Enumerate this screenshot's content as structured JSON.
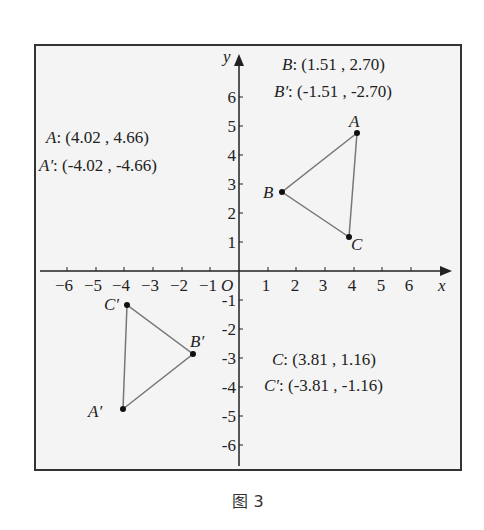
{
  "figure": {
    "caption": "图 3",
    "axes": {
      "x_label": "x",
      "y_label": "y",
      "origin_label": "O",
      "x_ticks": [
        "−6",
        "−5",
        "−4",
        "−3",
        "−2",
        "−1",
        "1",
        "2",
        "3",
        "4",
        "5",
        "6"
      ],
      "y_ticks_pos": [
        "1",
        "2",
        "3",
        "4",
        "5",
        "6"
      ],
      "y_ticks_neg": [
        "-1",
        "-2",
        "-3",
        "-4",
        "-5",
        "-6"
      ]
    },
    "points": {
      "A": {
        "label": "A",
        "x": 4.02,
        "y": 4.66
      },
      "B": {
        "label": "B",
        "x": 1.51,
        "y": 2.7
      },
      "C": {
        "label": "C",
        "x": 3.81,
        "y": 1.16
      },
      "A_prime": {
        "label": "A′",
        "x": -4.02,
        "y": -4.66
      },
      "B_prime": {
        "label": "B′",
        "x": -1.51,
        "y": -2.7
      },
      "C_prime": {
        "label": "C′",
        "x": -3.81,
        "y": -1.16
      }
    },
    "coordinate_labels": {
      "A": {
        "name": "A",
        "value": ":  (4.02 ,  4.66)"
      },
      "A_prime": {
        "name": "A′",
        "value": ":  (-4.02 ,  -4.66)"
      },
      "B": {
        "name": "B",
        "value": ":  (1.51 ,  2.70)"
      },
      "B_prime": {
        "name": "B′",
        "value": ":  (-1.51 ,  -2.70)"
      },
      "C": {
        "name": "C",
        "value": ":  (3.81 ,  1.16)"
      },
      "C_prime": {
        "name": "C′",
        "value": ":  (-3.81 ,  -1.16)"
      }
    },
    "colors": {
      "frame": "#333333",
      "background": "#f4f4f4",
      "triangle": "#777777",
      "axis": "#222222"
    }
  }
}
